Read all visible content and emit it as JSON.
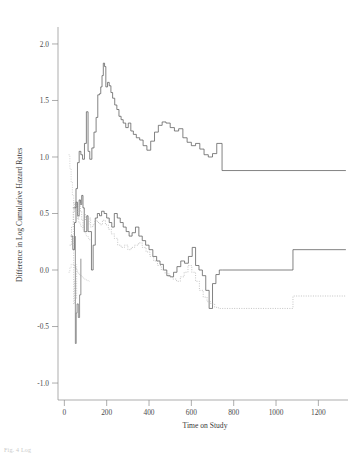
{
  "figure": {
    "caption_faint": "Fig. 4 Log",
    "background": "#ffffff",
    "line_color_solid": "#5a5a5a",
    "line_color_dotted": "#b4b4b4"
  },
  "chart_data": {
    "type": "line",
    "title": "",
    "xlabel": "Time on Study",
    "ylabel": "Difference in Log Cumulative Hazard Rates",
    "xlim": [
      -30,
      1340
    ],
    "ylim": [
      -1.15,
      2.15
    ],
    "xticks": [
      0,
      200,
      400,
      600,
      800,
      1000,
      1200
    ],
    "xticklabels": [
      "0",
      "200",
      "400",
      "600",
      "800",
      "1000",
      "1200"
    ],
    "yticks": [
      -1.0,
      -0.5,
      0.0,
      0.5,
      1.0,
      1.5,
      2.0
    ],
    "yticklabels": [
      "-1.0",
      "-0.5",
      "0.0",
      "0.5",
      "1.0",
      "1.5",
      "2.0"
    ],
    "grid": false,
    "legend": "none",
    "step_interpolation": "hv",
    "series": [
      {
        "name": "upper-curve-solid",
        "style": "solid",
        "color": "#5a5a5a",
        "x": [
          40,
          55,
          62,
          70,
          78,
          86,
          95,
          104,
          112,
          120,
          130,
          140,
          150,
          158,
          166,
          172,
          178,
          184,
          190,
          196,
          204,
          212,
          220,
          228,
          238,
          248,
          258,
          268,
          278,
          290,
          302,
          314,
          326,
          340,
          356,
          372,
          390,
          408,
          426,
          444,
          462,
          480,
          500,
          520,
          540,
          560,
          580,
          600,
          620,
          640,
          660,
          680,
          700,
          720,
          745,
          1330
        ],
        "y": [
          0.55,
          0.72,
          0.95,
          1.05,
          1.02,
          0.98,
          1.12,
          1.4,
          1.05,
          0.98,
          1.08,
          1.22,
          1.35,
          1.55,
          1.56,
          1.62,
          1.72,
          1.83,
          1.8,
          1.62,
          1.66,
          1.63,
          1.57,
          1.52,
          1.46,
          1.42,
          1.36,
          1.33,
          1.3,
          1.26,
          1.3,
          1.23,
          1.2,
          1.17,
          1.15,
          1.1,
          1.06,
          1.14,
          1.22,
          1.28,
          1.31,
          1.3,
          1.26,
          1.23,
          1.25,
          1.17,
          1.13,
          1.1,
          1.12,
          1.07,
          1.02,
          1.0,
          1.03,
          1.12,
          0.88,
          0.88
        ]
      },
      {
        "name": "middle-curve-solid",
        "style": "solid",
        "color": "#5a5a5a",
        "x": [
          30,
          40,
          48,
          55,
          62,
          70,
          76,
          82,
          88,
          94,
          100,
          106,
          112,
          120,
          128,
          136,
          146,
          156,
          166,
          176,
          188,
          200,
          212,
          224,
          236,
          250,
          264,
          278,
          292,
          306,
          320,
          336,
          352,
          368,
          384,
          400,
          418,
          436,
          452,
          468,
          484,
          500,
          516,
          532,
          550,
          568,
          586,
          604,
          620,
          636,
          652,
          668,
          684,
          700,
          716,
          732,
          748,
          1080,
          1330
        ],
        "y": [
          0.3,
          0.18,
          0.42,
          0.6,
          0.48,
          0.62,
          0.58,
          0.66,
          0.55,
          0.34,
          0.34,
          0.48,
          0.34,
          0.34,
          0.0,
          0.22,
          0.46,
          0.5,
          0.48,
          0.52,
          0.5,
          0.46,
          0.42,
          0.38,
          0.5,
          0.46,
          0.42,
          0.38,
          0.34,
          0.3,
          0.33,
          0.38,
          0.3,
          0.26,
          0.22,
          0.18,
          0.12,
          0.08,
          0.05,
          0.0,
          -0.05,
          -0.06,
          -0.02,
          0.03,
          0.08,
          0.06,
          0.12,
          0.2,
          0.04,
          0.0,
          -0.05,
          -0.18,
          -0.34,
          -0.12,
          -0.04,
          0.0,
          0.0,
          0.18,
          0.18
        ]
      },
      {
        "name": "lower-curve-dotted",
        "style": "dotted",
        "color": "#b0b0b0",
        "x": [
          25,
          34,
          42,
          50,
          58,
          64,
          70,
          76,
          82,
          88,
          94,
          100,
          108,
          116,
          124,
          134,
          144,
          156,
          168,
          180,
          194,
          208,
          222,
          236,
          252,
          268,
          284,
          300,
          316,
          332,
          350,
          368,
          386,
          404,
          422,
          440,
          458,
          476,
          494,
          512,
          530,
          548,
          566,
          584,
          602,
          620,
          638,
          656,
          674,
          692,
          710,
          728,
          746,
          1080,
          1330
        ],
        "y": [
          0.22,
          0.38,
          0.52,
          0.6,
          0.55,
          0.46,
          0.6,
          0.52,
          0.44,
          0.38,
          0.5,
          0.44,
          0.4,
          0.46,
          0.38,
          0.4,
          0.44,
          0.42,
          0.4,
          0.44,
          0.4,
          0.36,
          0.32,
          0.28,
          0.22,
          0.2,
          0.22,
          0.18,
          0.2,
          0.22,
          0.24,
          0.2,
          0.16,
          0.12,
          0.08,
          0.04,
          0.0,
          -0.03,
          -0.06,
          -0.08,
          -0.1,
          -0.06,
          -0.02,
          0.04,
          -0.02,
          -0.1,
          -0.18,
          -0.24,
          -0.28,
          -0.3,
          -0.33,
          -0.34,
          -0.34,
          -0.23,
          -0.23
        ]
      },
      {
        "name": "early-confidence-band-left-dotted",
        "style": "dotted",
        "color": "#c6c6c6",
        "x": [
          20,
          26,
          32,
          38,
          44,
          50,
          56,
          62,
          68,
          74,
          80,
          86,
          92,
          98,
          104,
          112,
          120
        ],
        "y": [
          1.02,
          0.9,
          0.78,
          0.66,
          0.58,
          0.52,
          0.48,
          0.45,
          0.42,
          0.4,
          0.38,
          0.36,
          0.34,
          0.32,
          0.3,
          0.28,
          0.26
        ]
      },
      {
        "name": "early-confidence-band-lower-dotted",
        "style": "dotted",
        "color": "#c6c6c6",
        "x": [
          20,
          26,
          32,
          38,
          44,
          50,
          56,
          62,
          68,
          74,
          80,
          86,
          92,
          98,
          104,
          112,
          120
        ],
        "y": [
          -0.02,
          0.02,
          0.05,
          0.05,
          0.04,
          0.02,
          0.0,
          -0.02,
          -0.04,
          -0.05,
          -0.06,
          -0.07,
          -0.08,
          -0.08,
          -0.09,
          -0.1,
          -0.1
        ]
      },
      {
        "name": "early-vertical-spike-deep-dip",
        "style": "solid",
        "color": "#707070",
        "x": [
          52,
          52,
          56,
          56,
          60,
          60,
          66,
          66,
          72,
          72,
          78,
          78
        ],
        "y": [
          0.3,
          -0.65,
          -0.65,
          -0.38,
          -0.38,
          -0.3,
          -0.3,
          -0.42,
          -0.42,
          -0.22,
          -0.22,
          0.1
        ]
      },
      {
        "name": "early-vertical-spike-secondary",
        "style": "dotted",
        "color": "#b8b8b8",
        "x": [
          44,
          44,
          48,
          48,
          54,
          54,
          58,
          58
        ],
        "y": [
          0.6,
          -0.3,
          -0.3,
          -0.1,
          -0.1,
          -0.25,
          -0.25,
          0.05
        ]
      }
    ]
  }
}
